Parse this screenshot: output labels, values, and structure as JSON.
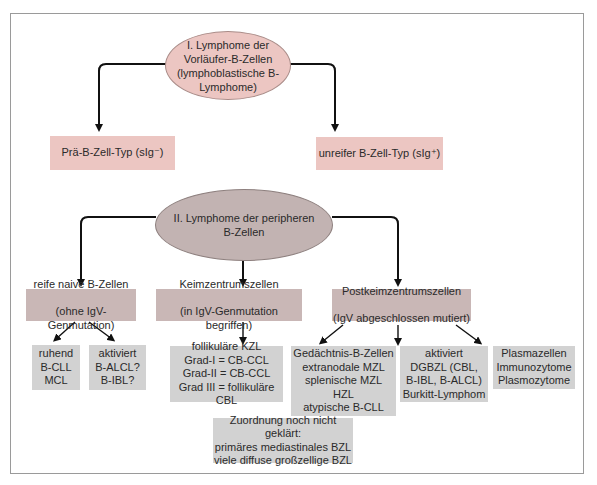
{
  "diagram": {
    "group1": {
      "root": {
        "line1": "I. Lymphome der Vorläufer-B-Zellen",
        "line2": "(lymphoblastische B-Lymphome)"
      },
      "children": [
        {
          "label": "Prä-B-Zell-Typ (sIg⁻)"
        },
        {
          "label": "unreifer B-Zell-Typ (sIg⁺)"
        }
      ]
    },
    "group2": {
      "root": {
        "line1": "II. Lymphome der peripheren",
        "line2": "B-Zellen"
      },
      "categories": [
        {
          "line1": "reife naive B-Zellen",
          "line2": "(ohne IgV-Genmutation)",
          "leaves": [
            {
              "text": "ruhend\nB-CLL\nMCL"
            },
            {
              "text": "aktiviert\nB-ALCL?\nB-IBL?"
            }
          ]
        },
        {
          "line1": "Keimzentrumszellen",
          "line2": "(in IgV-Genmutation begriffen)",
          "leaves": [
            {
              "text": "follikuläre KZL\nGrad-I = CB-CCL\nGrad-II = CB-CCL\nGrad III = follikuläre CBL"
            }
          ]
        },
        {
          "line1": "Postkeimzentrumszellen",
          "line2": "(IgV abgeschlossen mutiert)",
          "leaves": [
            {
              "text": "Gedächtnis-B-Zellen\nextranodale MZL\nsplenische MZL\nHZL\natypische B-CLL"
            },
            {
              "text": "aktiviert\nDGBZL (CBL,\nB-IBL, B-ALCL)\nBurkitt-Lymphom"
            },
            {
              "text": "Plasmazellen\nImmunozytome\nPlasmozytome"
            }
          ]
        }
      ],
      "unassigned": {
        "text": "Zuordnung noch nicht geklärt:\nprimäres mediastinales BZL\nviele diffuse großzellige BZL"
      }
    },
    "colors": {
      "pink": "#ecc6c2",
      "mauve": "#c9b7b6",
      "grey": "#d2d2d2",
      "line": "#111111"
    }
  }
}
